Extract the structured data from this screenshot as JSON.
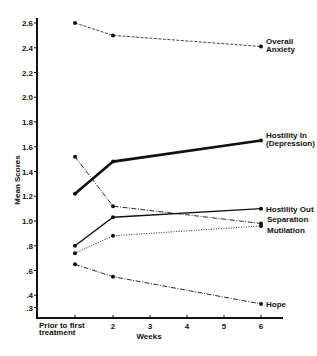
{
  "chart_data": {
    "type": "line",
    "title": "",
    "xlabel": "Weeks",
    "ylabel": "Mean Scores",
    "x": [
      "Prior to first treatment",
      "2",
      "6"
    ],
    "x_numeric": [
      1,
      2,
      6
    ],
    "x_ticks": [
      {
        "value": 1,
        "label": "Prior to first",
        "label2": "treatment"
      },
      {
        "value": 2,
        "label": "2"
      },
      {
        "value": 3,
        "label": "3"
      },
      {
        "value": 4,
        "label": "4"
      },
      {
        "value": 5,
        "label": "5"
      },
      {
        "value": 6,
        "label": "6"
      }
    ],
    "y_ticks": [
      {
        "value": 2.6,
        "label": "2.6"
      },
      {
        "value": 2.4,
        "label": "2.4"
      },
      {
        "value": 2.2,
        "label": "2.2"
      },
      {
        "value": 2.0,
        "label": "2.0"
      },
      {
        "value": 1.8,
        "label": "1.8"
      },
      {
        "value": 1.6,
        "label": "1.6"
      },
      {
        "value": 1.4,
        "label": "1.4"
      },
      {
        "value": 1.2,
        "label": "1.2"
      },
      {
        "value": 1.0,
        "label": "1.0"
      },
      {
        "value": 0.8,
        "label": ".8"
      },
      {
        "value": 0.6,
        "label": ".6"
      },
      {
        "value": 0.4,
        "label": ".4"
      },
      {
        "value": 0.3,
        "label": ".3"
      }
    ],
    "ylim": [
      0.3,
      2.6
    ],
    "xlim": [
      1,
      6
    ],
    "grid": false,
    "legend": "inline labels at right end of each line",
    "series": [
      {
        "name": "Overall Anxiety",
        "label_lines": [
          "Overall",
          "Anxiety"
        ],
        "style": "dashed",
        "width": 0.8,
        "values": [
          2.6,
          2.5,
          2.41
        ]
      },
      {
        "name": "Hostility In (Depression)",
        "label_lines": [
          "Hostility In",
          "(Depression)"
        ],
        "style": "solid",
        "width": 2.6,
        "values": [
          1.22,
          1.48,
          1.65
        ]
      },
      {
        "name": "Hostility Out",
        "label_lines": [
          "Hostility Out"
        ],
        "style": "solid",
        "width": 1.4,
        "values": [
          0.8,
          1.03,
          1.1
        ]
      },
      {
        "name": "Separation",
        "label_lines": [
          "Separation"
        ],
        "style": "dashdot",
        "width": 0.9,
        "values": [
          1.52,
          1.12,
          0.98
        ]
      },
      {
        "name": "Mutilation",
        "label_lines": [
          "Mutilation"
        ],
        "style": "dotted",
        "width": 0.9,
        "values": [
          0.74,
          0.88,
          0.96
        ]
      },
      {
        "name": "Hope",
        "label_lines": [
          "Hope"
        ],
        "style": "dashdot",
        "width": 0.9,
        "values": [
          0.65,
          0.55,
          0.33
        ]
      }
    ]
  },
  "layout": {
    "plot": {
      "x0": 37,
      "y_axis_top": 18,
      "baseline_y": 318,
      "x_right": 283
    },
    "x_px": {
      "1": 75,
      "2": 113,
      "3": 150,
      "4": 187,
      "5": 224,
      "6": 261
    },
    "y_ref": {
      "v1": 2.6,
      "py1": 23,
      "v2": 1.0,
      "py2": 221
    },
    "label_offsets": {
      "Overall Anxiety": [
        5,
        -3
      ],
      "Hostility In (Depression)": [
        5,
        -3
      ],
      "Hostility Out": [
        5,
        3
      ],
      "Separation": [
        6,
        -1
      ],
      "Mutilation": [
        6,
        7
      ],
      "Hope": [
        5,
        3
      ]
    }
  }
}
